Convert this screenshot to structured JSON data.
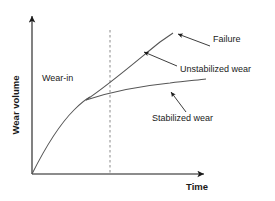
{
  "figure": {
    "kind": "line-diagram",
    "background_color": "#ffffff",
    "line_color": "#555555",
    "axis_color": "#1a1a1a",
    "text_color": "#1a1a1a",
    "dashed_line_color": "#888888"
  },
  "axes": {
    "y_label": "Wear volume",
    "x_label": "Time",
    "y_label_rotation": -90,
    "origin": {
      "x": 32,
      "y": 174
    },
    "x_end": {
      "x": 208,
      "y": 174
    },
    "y_end": {
      "x": 32,
      "y": 14
    },
    "has_ticks": false,
    "has_grid": false
  },
  "annotations": [
    {
      "id": "wear-in",
      "label": "Wear-in",
      "text_x": 42,
      "text_y": 81,
      "has_leader": false
    },
    {
      "id": "failure",
      "label": "Failure",
      "text_x": 213,
      "text_y": 42,
      "has_leader": true,
      "leader_from": {
        "x": 210,
        "y": 46
      },
      "leader_to": {
        "x": 174,
        "y": 33
      }
    },
    {
      "id": "unstabilized-wear",
      "label": "Unstabilized wear",
      "text_x": 180,
      "text_y": 72,
      "has_leader": true,
      "leader_from": {
        "x": 177,
        "y": 66
      },
      "leader_to": {
        "x": 140,
        "y": 51
      }
    },
    {
      "id": "stabilized-wear",
      "label": "Stabilized wear",
      "text_x": 152,
      "text_y": 121,
      "has_leader": true,
      "leader_from": {
        "x": 186,
        "y": 112
      },
      "leader_to": {
        "x": 168,
        "y": 90
      }
    }
  ],
  "curves": [
    {
      "id": "wear-in-curve",
      "name": "Wear-in running-in curve",
      "style": "solid",
      "path": "M 32 174 C 44 150 60 124 74 110 C 82 102 86 99 90 97"
    },
    {
      "id": "unstabilized-wear-curve",
      "name": "Unstabilized wear curve rising to failure",
      "style": "solid",
      "path": "M 86 100 C 110 84 140 58 160 42 C 166 38 170 35 173 33"
    },
    {
      "id": "stabilized-wear-curve",
      "name": "Stabilized wear curve flattening out",
      "style": "solid",
      "path": "M 86 100 C 110 92 140 86 170 83 C 186 81 198 80 206 79"
    }
  ],
  "reference_lines": [
    {
      "id": "transition-line",
      "orientation": "vertical",
      "style": "dashed",
      "x": 110,
      "y_top": 30,
      "y_bottom": 174
    }
  ]
}
